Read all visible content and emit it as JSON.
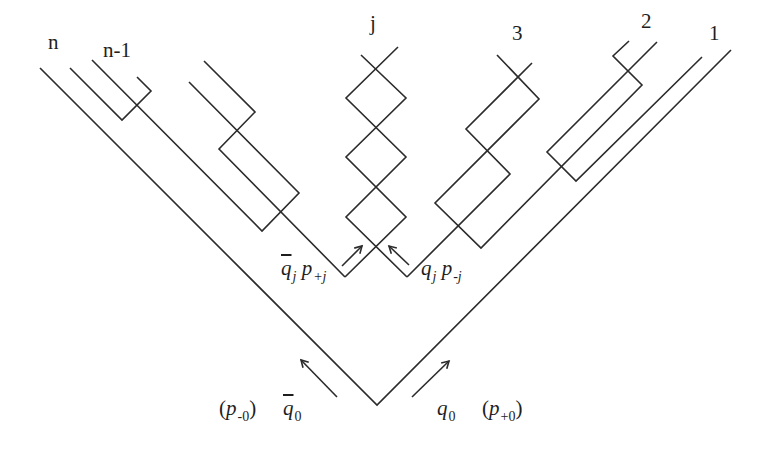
{
  "diagram": {
    "stroke_color": "#2b2b2b",
    "background": "#ffffff",
    "top_labels": [
      {
        "id": "n",
        "text": "n",
        "x": 48,
        "y": 44,
        "italic": true
      },
      {
        "id": "n-minus-1",
        "text": "n-1",
        "x": 103,
        "y": 52,
        "italic": true
      },
      {
        "id": "j",
        "text": "j",
        "x": 370,
        "y": 25,
        "italic": true
      },
      {
        "id": "3",
        "text": "3",
        "x": 512,
        "y": 35,
        "italic": false
      },
      {
        "id": "2",
        "text": "2",
        "x": 641,
        "y": 23,
        "italic": false
      },
      {
        "id": "1",
        "text": "1",
        "x": 709,
        "y": 35,
        "italic": false
      }
    ],
    "formula_labels": {
      "qbar_j_p_plus_j": {
        "x": 281,
        "y": 262,
        "base1": "q",
        "bar1": true,
        "sub1": "j",
        "base2": "p",
        "sub2": "+j"
      },
      "q_j_p_minus_j": {
        "x": 421,
        "y": 262,
        "base1": "q",
        "bar1": false,
        "sub1": "j",
        "base2": "p",
        "sub2": "-j"
      },
      "p_minus_0": {
        "x": 219,
        "y": 400,
        "text_open": "(",
        "base": "p",
        "sub": "-0",
        "text_close": ")"
      },
      "qbar_0": {
        "x": 283,
        "y": 400,
        "base": "q",
        "bar": true,
        "sub": "0"
      },
      "q_0": {
        "x": 437,
        "y": 400,
        "base": "q",
        "bar": false,
        "sub": "0"
      },
      "p_plus_0": {
        "x": 482,
        "y": 400,
        "text_open": "(",
        "base": "p",
        "sub": "+0",
        "text_close": ")"
      }
    },
    "polylines": [
      {
        "name": "line-n-outer-v",
        "points": [
          [
            40,
            68
          ],
          [
            377,
            405
          ],
          [
            731,
            50
          ]
        ]
      },
      {
        "name": "line-n-minus-1-bracket",
        "points": [
          [
            70,
            68
          ],
          [
            122,
            120
          ],
          [
            151,
            91
          ],
          [
            137,
            77
          ]
        ]
      },
      {
        "name": "left-box-line-b",
        "points": [
          [
            92,
            60
          ],
          [
            262,
            231
          ],
          [
            299,
            193
          ],
          [
            189,
            82
          ]
        ]
      },
      {
        "name": "left-box-line-a",
        "points": [
          [
            204,
            61
          ],
          [
            255,
            112
          ],
          [
            219,
            149
          ],
          [
            345,
            277
          ]
        ]
      },
      {
        "name": "j-chain-left",
        "points": [
          [
            345,
            277
          ],
          [
            406,
            217
          ],
          [
            346,
            157
          ],
          [
            406,
            98
          ],
          [
            361,
            55
          ]
        ]
      },
      {
        "name": "j-chain-right",
        "points": [
          [
            407,
            277
          ],
          [
            346,
            217
          ],
          [
            406,
            157
          ],
          [
            346,
            98
          ],
          [
            398,
            47
          ]
        ]
      },
      {
        "name": "line-3-q",
        "points": [
          [
            532,
            63
          ],
          [
            466,
            129
          ],
          [
            510,
            174
          ],
          [
            407,
            277
          ]
        ]
      },
      {
        "name": "line-3-p",
        "points": [
          [
            497,
            55
          ],
          [
            539,
            99
          ],
          [
            435,
            203
          ],
          [
            481,
            248
          ],
          [
            642,
            85
          ],
          [
            613,
            56
          ],
          [
            629,
            41
          ]
        ]
      },
      {
        "name": "line-2-long",
        "points": [
          [
            657,
            42
          ],
          [
            547,
            152
          ],
          [
            576,
            181
          ],
          [
            702,
            57
          ]
        ]
      }
    ],
    "arrows": [
      {
        "name": "arrow-qbar-j",
        "from": [
          342,
          266
        ],
        "to": [
          362,
          246
        ]
      },
      {
        "name": "arrow-q-j",
        "from": [
          409,
          265
        ],
        "to": [
          389,
          246
        ]
      },
      {
        "name": "arrow-qbar-0",
        "from": [
          337,
          397
        ],
        "to": [
          301,
          360
        ]
      },
      {
        "name": "arrow-q-0",
        "from": [
          412,
          397
        ],
        "to": [
          449,
          361
        ]
      }
    ]
  }
}
